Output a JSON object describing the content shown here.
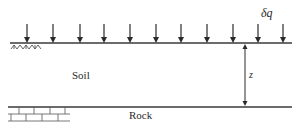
{
  "diagram": {
    "labels": {
      "soil": "Soil",
      "rock": "Rock",
      "depth": "z",
      "load": "δq"
    },
    "load_arrows": {
      "count": 11,
      "x_positions": [
        27,
        53,
        80,
        104,
        130,
        156,
        181,
        207,
        233,
        258,
        283
      ]
    },
    "colors": {
      "line": "#3a3a3a",
      "text": "#2a2a2a",
      "hatch": "#555555",
      "background": "#ffffff"
    }
  }
}
